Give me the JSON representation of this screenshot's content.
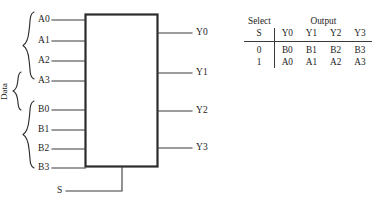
{
  "figure": {
    "type": "logic-diagram",
    "device": "quad 2-to-1 multiplexer",
    "inputs_group_a": [
      {
        "label": "A0",
        "y": 20
      },
      {
        "label": "A1",
        "y": 41
      },
      {
        "label": "A2",
        "y": 61
      },
      {
        "label": "A3",
        "y": 81
      }
    ],
    "inputs_group_b": [
      {
        "label": "B0",
        "y": 110
      },
      {
        "label": "B1",
        "y": 130
      },
      {
        "label": "B2",
        "y": 149
      },
      {
        "label": "B3",
        "y": 168
      }
    ],
    "outputs": [
      {
        "label": "Y0",
        "y": 33
      },
      {
        "label": "Y1",
        "y": 73
      },
      {
        "label": "Y2",
        "y": 111
      },
      {
        "label": "Y3",
        "y": 148
      }
    ],
    "select_input": {
      "label": "S",
      "y": 191
    },
    "group_brace_label": "Data",
    "colors": {
      "line": "#3a3a3a",
      "box_outline": "#2b2b2b",
      "text": "#1c1c1c",
      "background": "#ffffff"
    }
  },
  "truth_table": {
    "group_headers": {
      "select": "Select",
      "output": "Output"
    },
    "column_headers": {
      "select": "S",
      "outputs": [
        "Y0",
        "Y1",
        "Y2",
        "Y3"
      ]
    },
    "rows": [
      {
        "s": "0",
        "outputs": [
          "B0",
          "B1",
          "B2",
          "B3"
        ]
      },
      {
        "s": "1",
        "outputs": [
          "A0",
          "A1",
          "A2",
          "A3"
        ]
      }
    ]
  }
}
